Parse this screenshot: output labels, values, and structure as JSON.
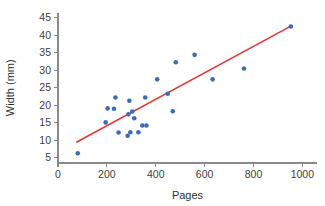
{
  "chart_data": {
    "type": "scatter",
    "title": "",
    "xlabel": "Pages",
    "ylabel": "Width (mm)",
    "xlim": [
      0,
      1060
    ],
    "ylim": [
      3.5,
      46.5
    ],
    "xticks": [
      0,
      200,
      400,
      600,
      800,
      1000
    ],
    "yticks": [
      5,
      10,
      15,
      20,
      25,
      30,
      35,
      40,
      45
    ],
    "xtick_labels": [
      "0",
      "200",
      "400",
      "600",
      "800",
      "1000"
    ],
    "ytick_labels": [
      "5",
      "10",
      "15",
      "20",
      "25",
      "30",
      "35",
      "40",
      "45"
    ],
    "grid": false,
    "legend": null,
    "point_color": "#3b6cb5",
    "line_color": "#e03a3a",
    "axis_color": "#8a8a8a",
    "points": [
      {
        "x": 81,
        "y": 6.3
      },
      {
        "x": 195,
        "y": 15.1
      },
      {
        "x": 203,
        "y": 19.1
      },
      {
        "x": 229,
        "y": 19.0
      },
      {
        "x": 235,
        "y": 22.2
      },
      {
        "x": 248,
        "y": 12.2
      },
      {
        "x": 285,
        "y": 11.3
      },
      {
        "x": 288,
        "y": 17.4
      },
      {
        "x": 292,
        "y": 21.3
      },
      {
        "x": 296,
        "y": 12.3
      },
      {
        "x": 304,
        "y": 18.2
      },
      {
        "x": 312,
        "y": 16.3
      },
      {
        "x": 329,
        "y": 12.3
      },
      {
        "x": 345,
        "y": 14.2
      },
      {
        "x": 357,
        "y": 22.2
      },
      {
        "x": 362,
        "y": 14.2
      },
      {
        "x": 406,
        "y": 27.4
      },
      {
        "x": 449,
        "y": 23.3
      },
      {
        "x": 470,
        "y": 18.3
      },
      {
        "x": 482,
        "y": 32.3
      },
      {
        "x": 559,
        "y": 34.4
      },
      {
        "x": 633,
        "y": 27.4
      },
      {
        "x": 761,
        "y": 30.5
      },
      {
        "x": 953,
        "y": 42.5
      }
    ],
    "fit_line": {
      "label": "least-squares regression line",
      "x_start": 77,
      "y_start": 9.5,
      "x_end": 953,
      "y_end": 42.6
    }
  },
  "axes": {
    "x_title": "Pages",
    "y_title": "Width (mm)"
  }
}
